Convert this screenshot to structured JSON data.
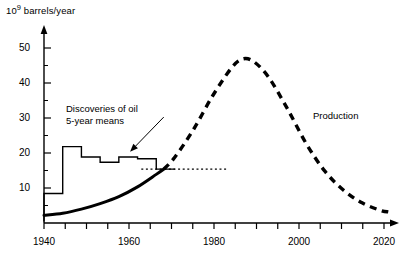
{
  "chart_data": {
    "type": "line",
    "title": "",
    "ylabel": "10⁹ barrels/year",
    "ylabel_base": "10",
    "ylabel_exp": "9",
    "ylabel_rest": " barrels/year",
    "xlabel": "",
    "xlim": [
      1940,
      2033
    ],
    "ylim": [
      0,
      55
    ],
    "grid": false,
    "legend_position": "inline-annotations",
    "y_ticks": [
      10,
      20,
      30,
      40,
      50
    ],
    "y_minor_tick_step": 5,
    "x_ticks": [
      1940,
      1945,
      1950,
      1955,
      1960,
      1965,
      1970,
      1975,
      1980,
      1985,
      1990,
      1995,
      2000,
      2005,
      2010,
      2015,
      2020,
      2025,
      2030
    ],
    "x_tick_labels": [
      "1940",
      "1960",
      "1980",
      "2000",
      "2020"
    ],
    "x_tick_label_values": [
      1940,
      1960,
      1980,
      2000,
      2020
    ],
    "series": [
      {
        "name": "Discoveries of oil, 5-year means",
        "style": "step",
        "line": "solid-thin",
        "x_edges": [
          1940,
          1945,
          1950,
          1955,
          1960,
          1965,
          1970,
          1975
        ],
        "values": [
          8.5,
          22.0,
          19.0,
          17.5,
          19.0,
          18.5,
          15.5
        ]
      },
      {
        "name": "Production (historic)",
        "style": "curve",
        "line": "solid-thick",
        "points": [
          [
            1940,
            2.2
          ],
          [
            1945,
            2.8
          ],
          [
            1950,
            4.0
          ],
          [
            1955,
            5.6
          ],
          [
            1960,
            7.6
          ],
          [
            1965,
            10.4
          ],
          [
            1970,
            14.0
          ],
          [
            1972,
            15.5
          ]
        ]
      },
      {
        "name": "Production (projected)",
        "style": "curve",
        "line": "dashed-thick",
        "points": [
          [
            1972,
            15.5
          ],
          [
            1975,
            19.0
          ],
          [
            1980,
            27.0
          ],
          [
            1985,
            36.5
          ],
          [
            1990,
            44.5
          ],
          [
            1993,
            47.2
          ],
          [
            1996,
            46.5
          ],
          [
            2000,
            42.0
          ],
          [
            2005,
            33.0
          ],
          [
            2010,
            23.0
          ],
          [
            2015,
            15.0
          ],
          [
            2020,
            9.5
          ],
          [
            2025,
            5.8
          ],
          [
            2030,
            3.6
          ],
          [
            2032,
            3.2
          ]
        ]
      },
      {
        "name": "Constant discovery reference level",
        "style": "horizontal-dotted",
        "line": "dotted-thin",
        "y": 15.5,
        "x_start": 1966,
        "x_end": 1989
      }
    ],
    "annotations": [
      {
        "name": "discoveries-annotation",
        "text": "Discoveries of oil\n5-year means",
        "line1": "Discoveries of oil",
        "line2": "5-year means",
        "arrow_from": [
          1972,
          30.5
        ],
        "arrow_to": [
          1963,
          20.5
        ]
      },
      {
        "name": "production-annotation",
        "text": "Production",
        "line1": "Production"
      }
    ],
    "colors": {
      "axis": "#000000",
      "discoveries": "#000000",
      "production": "#000000",
      "background": "#ffffff"
    }
  },
  "figure": {
    "y_axis_title": "barrels/year",
    "y_axis_title_prefix": "10",
    "y_axis_title_exponent": "9",
    "y_tick_labels": [
      "50",
      "40",
      "30",
      "20",
      "10"
    ],
    "x_tick_labels": [
      "1940",
      "1960",
      "1980",
      "2000",
      "2020"
    ],
    "annotation_discoveries_line1": "Discoveries of oil",
    "annotation_discoveries_line2": "5-year means",
    "annotation_production": "Production"
  }
}
